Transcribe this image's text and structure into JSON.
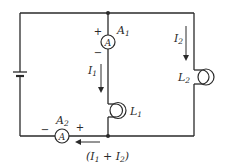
{
  "diagram": {
    "type": "parallel circuit with two lamps and two ammeters",
    "colors": {
      "ink": "#2a2a2a",
      "background": "#ffffff"
    },
    "battery": {
      "label": ""
    },
    "ammeter_1": {
      "name": "A",
      "sub": "1",
      "symbol": "A",
      "plus": "+",
      "minus": "−"
    },
    "ammeter_2": {
      "name": "A",
      "sub": "2",
      "symbol": "A",
      "plus": "+",
      "minus": "−"
    },
    "lamp_1": {
      "name": "L",
      "sub": "1"
    },
    "lamp_2": {
      "name": "L",
      "sub": "2"
    },
    "current_1": {
      "name": "I",
      "sub": "1"
    },
    "current_2": {
      "name": "I",
      "sub": "2"
    },
    "total_current": {
      "open": "(",
      "i1": "I",
      "s1": "1",
      "plus": " + ",
      "i2": "I",
      "s2": "2",
      "close": ")"
    }
  }
}
